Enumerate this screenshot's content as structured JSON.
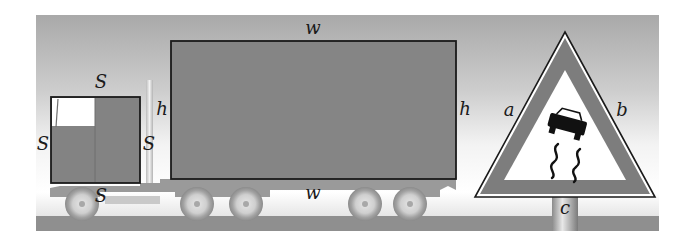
{
  "figure": {
    "colors": {
      "sky_top": "#a9a9a9",
      "sky_bottom": "#f4f4f4",
      "road": "#8f8f8f",
      "vehicle_fill": "#838383",
      "outline": "#1a1a1a",
      "wheel": "#bdbdbd",
      "sign_border": "#7d7d7d",
      "sign_inner": "#ffffff"
    }
  },
  "labels": {
    "cab_top": "S",
    "cab_left": "S",
    "cab_right": "S",
    "cab_bottom": "S",
    "container_top": "w",
    "container_bottom": "w",
    "container_left": "h",
    "container_right": "h",
    "sign_left": "a",
    "sign_right": "b",
    "sign_base": "c"
  },
  "shapes": {
    "cab": "square",
    "container": "rectangle",
    "sign": "triangle",
    "sign_symbol": "slippery-road car"
  }
}
